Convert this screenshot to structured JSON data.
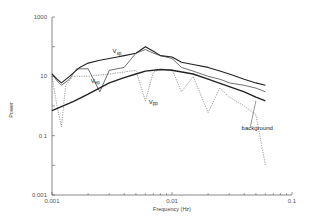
{
  "chart_data": {
    "type": "line",
    "title": "",
    "xlabel": "Frequency (Hz)",
    "ylabel": "Power",
    "xscale": "log",
    "yscale": "log",
    "xlim": [
      0.001,
      0.1
    ],
    "ylim": [
      0.001,
      1000
    ],
    "x_ticks": [
      "0.001",
      "0.01",
      "0.1"
    ],
    "y_ticks": [
      "0.001",
      "0.1",
      "10",
      "1000"
    ],
    "grid": false,
    "legend": "none (inline annotations)",
    "annotations": [
      {
        "text": "V",
        "sub": "sp",
        "x": 0.0032,
        "y": 60
      },
      {
        "text": "V",
        "sub": "ep",
        "x": 0.0021,
        "y": 6
      },
      {
        "text": "V",
        "sub": "pp",
        "x": 0.0064,
        "y": 1.2
      },
      {
        "text": "background",
        "x": 0.038,
        "y": 0.15
      }
    ],
    "series": [
      {
        "name": "V_sp",
        "style": "solid-thick",
        "x": [
          0.001,
          0.0011,
          0.0012,
          0.0014,
          0.0017,
          0.002,
          0.0025,
          0.003,
          0.0035,
          0.004,
          0.005,
          0.006,
          0.007,
          0.008,
          0.01,
          0.012,
          0.015,
          0.02,
          0.025,
          0.03,
          0.04,
          0.05,
          0.06
        ],
        "y": [
          12,
          8,
          6,
          10,
          20,
          28,
          35,
          40,
          45,
          50,
          60,
          100,
          70,
          50,
          45,
          30,
          25,
          20,
          15,
          12,
          8,
          6,
          5
        ]
      },
      {
        "name": "V_ep",
        "style": "solid-thin",
        "x": [
          0.001,
          0.0011,
          0.0012,
          0.0014,
          0.0016,
          0.002,
          0.0025,
          0.003,
          0.004,
          0.005,
          0.006,
          0.007,
          0.008,
          0.01,
          0.012,
          0.015,
          0.02,
          0.025,
          0.03,
          0.04,
          0.05,
          0.06
        ],
        "y": [
          12,
          7,
          5,
          8,
          18,
          18,
          3,
          16,
          20,
          60,
          80,
          60,
          50,
          40,
          20,
          15,
          10,
          8,
          6,
          5,
          4,
          3
        ]
      },
      {
        "name": "V_pp",
        "style": "dotted",
        "x": [
          0.001,
          0.0011,
          0.0012,
          0.0013,
          0.0015,
          0.002,
          0.003,
          0.004,
          0.005,
          0.006,
          0.007,
          0.008,
          0.01,
          0.012,
          0.015,
          0.02,
          0.025,
          0.03,
          0.04,
          0.05,
          0.06
        ],
        "y": [
          10,
          1,
          0.2,
          5,
          10,
          10,
          12,
          14,
          16,
          1.5,
          14,
          17,
          17,
          3,
          10,
          0.6,
          4,
          2,
          1,
          0.5,
          0.01
        ]
      },
      {
        "name": "background",
        "style": "solid-thick-smooth",
        "x": [
          0.001,
          0.0015,
          0.002,
          0.003,
          0.004,
          0.005,
          0.006,
          0.008,
          0.01,
          0.015,
          0.02,
          0.03,
          0.04,
          0.05,
          0.06
        ],
        "y": [
          0.7,
          1.4,
          2.5,
          6,
          9,
          12,
          15,
          17,
          16,
          12,
          8,
          4.5,
          3,
          2,
          1.5
        ]
      }
    ]
  }
}
